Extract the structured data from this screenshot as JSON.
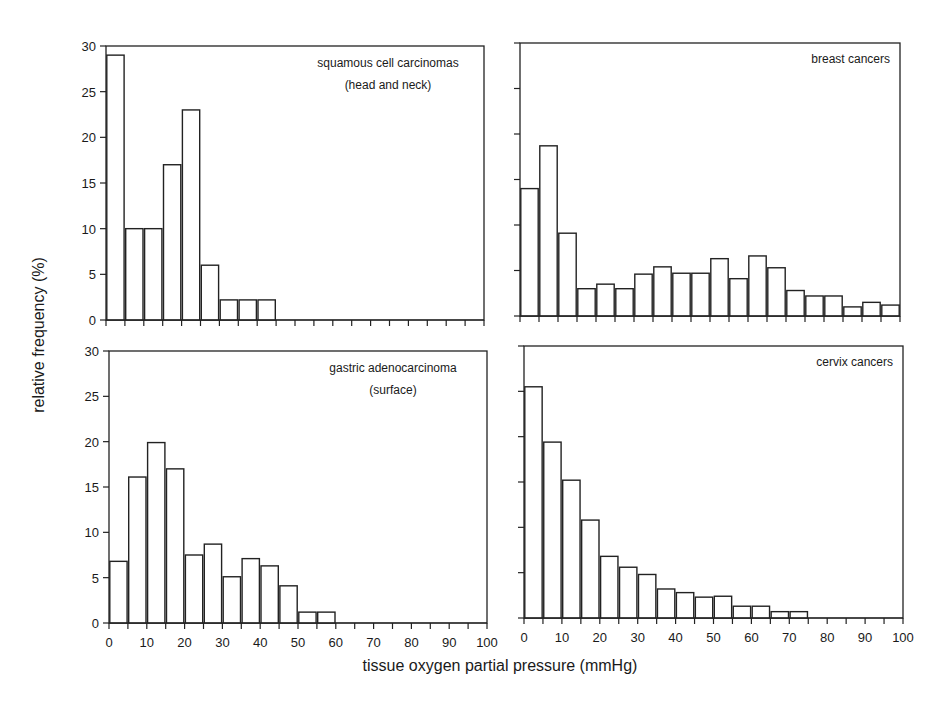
{
  "figure": {
    "ylabel": "relative frequency (%)",
    "xlabel": "tissue oxygen partial pressure  (mmHg)"
  },
  "chart_data": [
    {
      "type": "bar",
      "title": "squamous cell carcinomas (head and neck)",
      "title_lines": [
        "squamous cell carcinomas",
        "(head and neck)"
      ],
      "xlabel": "tissue oxygen partial pressure (mmHg)",
      "ylabel": "relative frequency (%)",
      "bin_width": 5,
      "bin_starts": [
        0,
        5,
        10,
        15,
        20,
        25,
        30,
        35,
        40
      ],
      "values": [
        29,
        10,
        10,
        17,
        23,
        6,
        2.2,
        2.2,
        2.2
      ],
      "xlim": [
        0,
        100
      ],
      "ylim": [
        0,
        30
      ],
      "yticks": [
        0,
        5,
        10,
        15,
        20,
        25,
        30
      ],
      "xticks": [
        0,
        10,
        20,
        30,
        40,
        50,
        60,
        70,
        80,
        90,
        100
      ],
      "show_yticklabels": true,
      "show_xticklabels": false
    },
    {
      "type": "bar",
      "title": "breast cancers",
      "title_lines": [
        "breast cancers"
      ],
      "xlabel": "tissue oxygen partial pressure (mmHg)",
      "ylabel": "relative frequency (%)",
      "bin_width": 5,
      "bin_starts": [
        0,
        5,
        10,
        15,
        20,
        25,
        30,
        35,
        40,
        45,
        50,
        55,
        60,
        65,
        70,
        75,
        80,
        85,
        90,
        95
      ],
      "values": [
        14.0,
        18.7,
        9.1,
        3.0,
        3.5,
        3.0,
        4.6,
        5.4,
        4.7,
        4.7,
        6.3,
        4.1,
        6.6,
        5.3,
        2.8,
        2.2,
        2.2,
        1.0,
        1.5,
        1.2
      ],
      "xlim": [
        0,
        100
      ],
      "ylim": [
        0,
        30
      ],
      "yticks": [
        0,
        5,
        10,
        15,
        20,
        25,
        30
      ],
      "xticks": [
        0,
        10,
        20,
        30,
        40,
        50,
        60,
        70,
        80,
        90,
        100
      ],
      "show_yticklabels": false,
      "show_xticklabels": false
    },
    {
      "type": "bar",
      "title": "gastric adenocarcinoma (surface)",
      "title_lines": [
        "gastric adenocarcinoma",
        "(surface)"
      ],
      "xlabel": "tissue oxygen partial pressure (mmHg)",
      "ylabel": "relative frequency (%)",
      "bin_width": 5,
      "bin_starts": [
        0,
        5,
        10,
        15,
        20,
        25,
        30,
        35,
        40,
        45,
        50,
        55
      ],
      "values": [
        6.8,
        16.1,
        19.9,
        17.0,
        7.5,
        8.7,
        5.1,
        7.1,
        6.3,
        4.1,
        1.2,
        1.2
      ],
      "xlim": [
        0,
        100
      ],
      "ylim": [
        0,
        30
      ],
      "yticks": [
        0,
        5,
        10,
        15,
        20,
        25,
        30
      ],
      "xticks": [
        0,
        10,
        20,
        30,
        40,
        50,
        60,
        70,
        80,
        90,
        100
      ],
      "show_yticklabels": true,
      "show_xticklabels": true
    },
    {
      "type": "bar",
      "title": "cervix cancers",
      "title_lines": [
        "cervix cancers"
      ],
      "xlabel": "tissue oxygen partial pressure (mmHg)",
      "ylabel": "relative frequency (%)",
      "bin_width": 5,
      "bin_starts": [
        0,
        5,
        10,
        15,
        20,
        25,
        30,
        35,
        40,
        45,
        50,
        55,
        60,
        65,
        70
      ],
      "values": [
        25.5,
        19.4,
        15.2,
        10.8,
        6.8,
        5.6,
        4.8,
        3.2,
        2.8,
        2.3,
        2.4,
        1.3,
        1.3,
        0.7,
        0.7
      ],
      "xlim": [
        0,
        100
      ],
      "ylim": [
        0,
        30
      ],
      "yticks": [
        0,
        5,
        10,
        15,
        20,
        25,
        30
      ],
      "xticks": [
        0,
        10,
        20,
        30,
        40,
        50,
        60,
        70,
        80,
        90,
        100
      ],
      "show_yticklabels": false,
      "show_xticklabels": true
    }
  ]
}
